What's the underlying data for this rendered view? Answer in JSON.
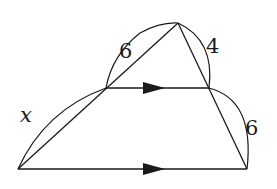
{
  "diagram": {
    "type": "geometry-triangle-parallel-lines",
    "labels": {
      "upper_left_segment": "6",
      "upper_right_segment": "4",
      "lower_right_segment": "6",
      "lower_left_segment": "x"
    },
    "points": {
      "apex": [
        178,
        23
      ],
      "left_mid": [
        106,
        88
      ],
      "right_mid": [
        209,
        88
      ],
      "bottom_left": [
        18,
        169
      ],
      "bottom_right": [
        247,
        169
      ]
    },
    "parallel_marker": "single-arrow",
    "colors": {
      "stroke": "#1a1a1a",
      "background": "#ffffff"
    }
  }
}
